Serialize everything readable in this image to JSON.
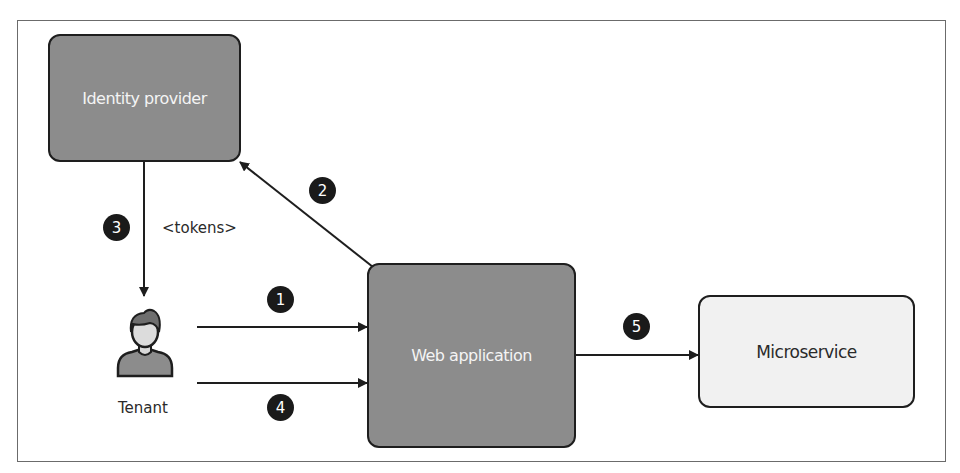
{
  "diagram": {
    "nodes": {
      "identity_provider": {
        "label": "Identity provider",
        "fill": "#8c8c8c"
      },
      "web_application": {
        "label": "Web application",
        "fill": "#8c8c8c"
      },
      "microservice": {
        "label": "Microservice",
        "fill": "#f1f1f1"
      },
      "tenant": {
        "label": "Tenant",
        "icon": "user-icon"
      }
    },
    "edges": [
      {
        "step": "1",
        "from": "Tenant",
        "to": "Web application"
      },
      {
        "step": "2",
        "from": "Web application",
        "to": "Identity provider"
      },
      {
        "step": "3",
        "from": "Identity provider",
        "to": "Tenant",
        "label": "<tokens>"
      },
      {
        "step": "4",
        "from": "Tenant",
        "to": "Web application"
      },
      {
        "step": "5",
        "from": "Web application",
        "to": "Microservice"
      }
    ]
  }
}
